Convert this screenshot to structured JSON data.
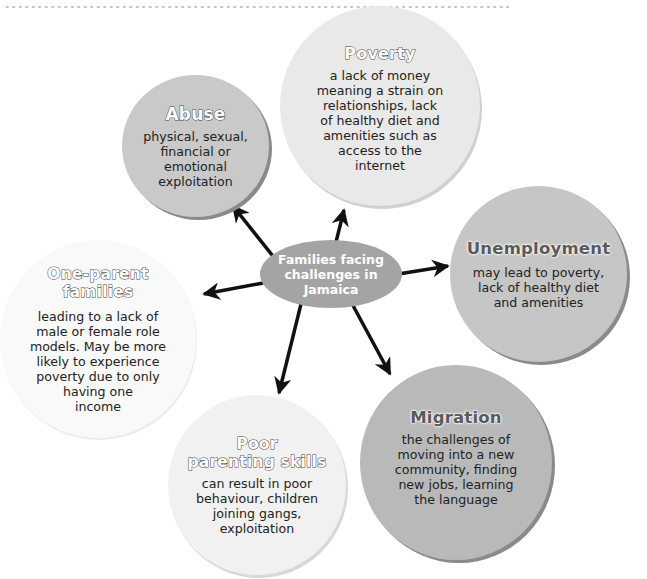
{
  "diagram": {
    "type": "spider-diagram",
    "center": {
      "label": "Families facing challenges in Jamaica",
      "lines": [
        "Families facing",
        "challenges in",
        "Jamaica"
      ],
      "color": "#a4a4a4"
    },
    "nodes": [
      {
        "id": "abuse",
        "title": "Abuse",
        "description_lines": [
          "physical, sexual,",
          "financial or",
          "emotional",
          "exploitation"
        ],
        "color": "#c9c9c9"
      },
      {
        "id": "poverty",
        "title": "Poverty",
        "description_lines": [
          "a lack of money",
          "meaning a strain on",
          "relationships, lack",
          "of healthy diet and",
          "amenities such as",
          "access to the",
          "internet"
        ],
        "color": "#e9e9e9"
      },
      {
        "id": "unemployment",
        "title": "Unemployment",
        "description_lines": [
          "may lead to poverty,",
          "lack of healthy diet",
          "and amenities"
        ],
        "color": "#c6c6c6"
      },
      {
        "id": "migration",
        "title": "Migration",
        "description_lines": [
          "the challenges of",
          "moving into a new",
          "community, finding",
          "new jobs, learning",
          "the language"
        ],
        "color": "#b9b9b9"
      },
      {
        "id": "poor-parenting-skills",
        "title_lines": [
          "Poor",
          "parenting skills"
        ],
        "description_lines": [
          "can result in poor",
          "behaviour, children",
          "joining gangs,",
          "exploitation"
        ],
        "color": "#f1f1f1"
      },
      {
        "id": "one-parent-families",
        "title_lines": [
          "One-parent",
          "families"
        ],
        "description_lines": [
          "leading to a lack of",
          "male or female role",
          "models. May be more",
          "likely to experience",
          "poverty due to only",
          "having one",
          "income"
        ],
        "color": "#f9f9f9"
      }
    ],
    "edges": [
      {
        "from": "center",
        "to": "abuse"
      },
      {
        "from": "center",
        "to": "poverty"
      },
      {
        "from": "center",
        "to": "unemployment"
      },
      {
        "from": "center",
        "to": "migration"
      },
      {
        "from": "center",
        "to": "poor-parenting-skills"
      },
      {
        "from": "center",
        "to": "one-parent-families"
      }
    ],
    "arrow_color": "#111111"
  }
}
